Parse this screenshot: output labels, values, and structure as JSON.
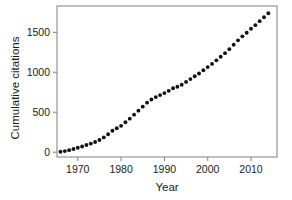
{
  "chart_data": {
    "type": "scatter",
    "title": "",
    "xlabel": "Year",
    "ylabel": "Cumulative citations",
    "xlim": [
      1965.2,
      2016.0
    ],
    "ylim": [
      -60,
      1830
    ],
    "grid": false,
    "legend": null,
    "marker": {
      "shape": "circle",
      "color": "#111111",
      "size": 3.0
    },
    "xticks": [
      1970,
      1980,
      1990,
      2000,
      2010
    ],
    "xtick_labels": [
      "1970",
      "1980",
      "1990",
      "2000",
      "2010"
    ],
    "yticks": [
      0,
      500,
      1000,
      1500
    ],
    "ytick_labels": [
      "0",
      "500",
      "1000",
      "1500"
    ],
    "x": [
      1966,
      1967,
      1968,
      1969,
      1970,
      1971,
      1972,
      1973,
      1974,
      1975,
      1976,
      1977,
      1978,
      1979,
      1980,
      1981,
      1982,
      1983,
      1984,
      1985,
      1986,
      1987,
      1988,
      1989,
      1990,
      1991,
      1992,
      1993,
      1994,
      1995,
      1996,
      1997,
      1998,
      1999,
      2000,
      2001,
      2002,
      2003,
      2004,
      2005,
      2006,
      2007,
      2008,
      2009,
      2010,
      2011,
      2012,
      2013,
      2014
    ],
    "y": [
      5,
      14,
      26,
      40,
      56,
      72,
      90,
      108,
      128,
      152,
      185,
      225,
      268,
      300,
      330,
      375,
      420,
      470,
      520,
      570,
      620,
      660,
      690,
      715,
      740,
      768,
      800,
      820,
      845,
      880,
      915,
      950,
      985,
      1025,
      1065,
      1105,
      1150,
      1195,
      1240,
      1290,
      1345,
      1400,
      1450,
      1495,
      1545,
      1590,
      1640,
      1690,
      1740
    ],
    "series": [
      {
        "name": "Cumulative citations",
        "values": [
          5,
          14,
          26,
          40,
          56,
          72,
          90,
          108,
          128,
          152,
          185,
          225,
          268,
          300,
          330,
          375,
          420,
          470,
          520,
          570,
          620,
          660,
          690,
          715,
          740,
          768,
          800,
          820,
          845,
          880,
          915,
          950,
          985,
          1025,
          1065,
          1105,
          1150,
          1195,
          1240,
          1290,
          1345,
          1400,
          1450,
          1495,
          1545,
          1590,
          1640,
          1690,
          1740
        ]
      }
    ]
  },
  "axes": {
    "x_title": "Year",
    "y_title": "Cumulative citations"
  }
}
